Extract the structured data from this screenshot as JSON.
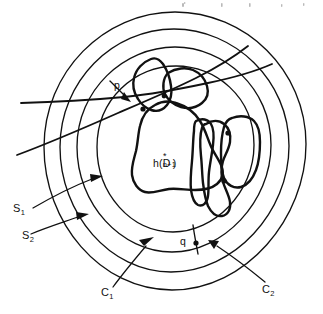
{
  "figure": {
    "kind": "hand-drawn mathematical topology diagram",
    "background_color": "#ffffff",
    "ink_color": "#111111",
    "width": 323,
    "height": 314,
    "labels": {
      "center_region": {
        "text": "h( D*n+1 )",
        "head": "h(",
        "symbol": "D",
        "superscript": "*",
        "subscript": "n+1",
        "tail": ")"
      },
      "point_p": "p",
      "point_q": "q",
      "curve_s1_base": "S",
      "curve_s1_sub": "1",
      "curve_s2_base": "S",
      "curve_s2_sub": "2",
      "circle_c1_base": "C",
      "circle_c1_sub": "1",
      "circle_c2_base": "C",
      "circle_c2_sub": "2"
    },
    "elements": {
      "concentric_circles": 4,
      "crossing_curves": 2,
      "irregular_blobs": 4,
      "intersection_dots": 5,
      "leader_arrows": 5
    }
  }
}
